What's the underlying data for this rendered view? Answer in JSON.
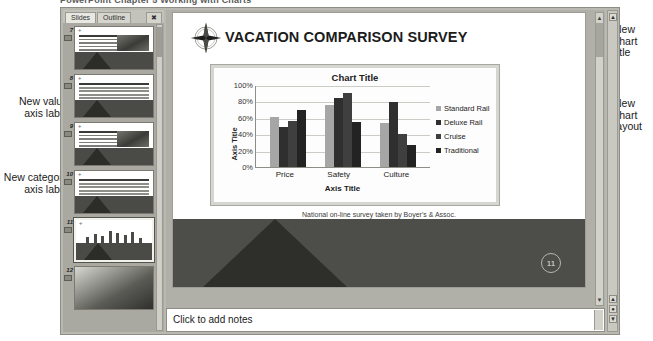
{
  "header": {
    "clipped_text": "PowerPoint Chapter 5 Working with Charts"
  },
  "window": {
    "slides_pane": {
      "tabs": [
        {
          "label": "Slides",
          "active": true
        },
        {
          "label": "Outline",
          "active": false
        }
      ],
      "close_label": "✖",
      "thumbnails": [
        {
          "number": "7",
          "kind": "bullets-image",
          "selected": false
        },
        {
          "number": "8",
          "kind": "table",
          "selected": false
        },
        {
          "number": "9",
          "kind": "bullets-image",
          "selected": false
        },
        {
          "number": "10",
          "kind": "table",
          "selected": false
        },
        {
          "number": "11",
          "kind": "chart",
          "selected": true
        },
        {
          "number": "12",
          "kind": "photo",
          "selected": false
        }
      ]
    },
    "slide": {
      "title": "VACATION COMPARISON SURVEY",
      "logo_icon": "compass-icon",
      "caption": "National on-line survey taken by Boyer's & Assoc.",
      "page_number": "11"
    },
    "notes": {
      "placeholder": "Click to add notes"
    },
    "scroll_icons": {
      "up": "▲",
      "down": "▼",
      "prev_slide": "▲",
      "next_slide": "▼",
      "select_browse": "●"
    }
  },
  "annotations": [
    {
      "id": "new-value-axis-label",
      "text": "New value axis label",
      "side": "left"
    },
    {
      "id": "new-category-axis-label",
      "text": "New category axis label",
      "side": "left"
    },
    {
      "id": "new-chart-title",
      "text": "New chart title",
      "side": "right"
    },
    {
      "id": "new-chart-layout",
      "text": "New chart layout",
      "side": "right"
    }
  ],
  "chart_data": {
    "type": "bar",
    "title": "Chart Title",
    "xlabel": "Axis Title",
    "ylabel": "Axis Title",
    "categories": [
      "Price",
      "Safety",
      "Culture"
    ],
    "series": [
      {
        "name": "Standard Rail",
        "color": "#a6a6a6",
        "values": [
          62,
          76,
          54
        ]
      },
      {
        "name": "Deluxe Rail",
        "color": "#2f2f2f",
        "values": [
          49,
          85,
          80
        ]
      },
      {
        "name": "Cruise",
        "color": "#3f3f3f",
        "values": [
          57,
          91,
          41
        ]
      },
      {
        "name": "Traditional",
        "color": "#232323",
        "values": [
          71,
          56,
          27
        ]
      }
    ],
    "ylim": [
      0,
      100
    ],
    "yticks": [
      "0%",
      "20%",
      "40%",
      "60%",
      "80%",
      "100%"
    ],
    "grid": true,
    "legend_position": "right"
  }
}
